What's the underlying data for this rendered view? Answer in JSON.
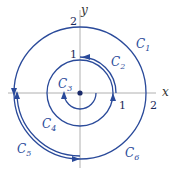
{
  "diagram": {
    "type": "contour-paths",
    "axes": {
      "x_label": "x",
      "y_label": "y",
      "tick_labels": {
        "x_1": "1",
        "x_2": "2",
        "y_1": "1",
        "y_2": "2"
      }
    },
    "curves": [
      {
        "id": "C1",
        "label": "C",
        "sub": "1",
        "description": "full circle radius 2"
      },
      {
        "id": "C2",
        "label": "C",
        "sub": "2",
        "description": "arc radius ~1 from positive x-axis counterclockwise to positive y-axis"
      },
      {
        "id": "C3",
        "label": "C",
        "sub": "3",
        "description": "small arc around origin, counterclockwise"
      },
      {
        "id": "C4",
        "label": "C",
        "sub": "4",
        "description": "full circle radius 1"
      },
      {
        "id": "C5",
        "label": "C",
        "sub": "5",
        "description": "arc radius 2 from negative x-axis to negative y-axis"
      },
      {
        "id": "C6",
        "label": "C",
        "sub": "6",
        "description": "arc radius 2 from negative y-axis back to negative x-axis"
      }
    ],
    "colors": {
      "curve": "#2a4a9a",
      "axis": "#a8a8a8",
      "text": "#2a4a9a"
    }
  }
}
